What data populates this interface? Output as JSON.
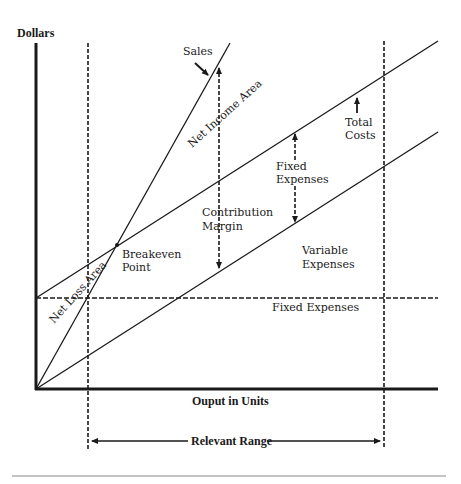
{
  "diagram": {
    "axes": {
      "y_label": "Dollars",
      "x_label": "Ouput in Units"
    },
    "lines": [
      {
        "name": "Sales",
        "style": "solid"
      },
      {
        "name": "Total Costs",
        "style": "solid"
      },
      {
        "name": "Variable Expenses",
        "style": "solid"
      },
      {
        "name": "Fixed Expenses",
        "style": "dashed"
      }
    ],
    "labels": {
      "sales": "Sales",
      "net_income_area": "Net Income Area",
      "net_loss_area": "Net Loss Area",
      "total_costs_line1": "Total",
      "total_costs_line2": "Costs",
      "fixed_expenses_upper_line1": "Fixed",
      "fixed_expenses_upper_line2": "Expenses",
      "contribution_margin_line1": "Contribution",
      "contribution_margin_line2": "Margin",
      "breakeven_line1": "Breakeven",
      "breakeven_line2": "Point",
      "variable_expenses_line1": "Variable",
      "variable_expenses_line2": "Expenses",
      "fixed_expenses_lower": "Fixed Expenses",
      "relevant_range": "Relevant Range"
    },
    "colors": {
      "ink": "#1a1a1a",
      "background": "#ffffff",
      "rule": "#888888"
    }
  }
}
